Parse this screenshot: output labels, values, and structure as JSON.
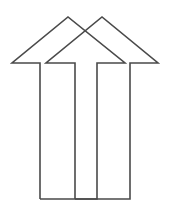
{
  "diagram": {
    "stroke_color": "#4a4a4a",
    "background": "#ffffff",
    "icons": [
      "arrow-up-outline-icon",
      "arrow-up-outline-icon"
    ]
  }
}
